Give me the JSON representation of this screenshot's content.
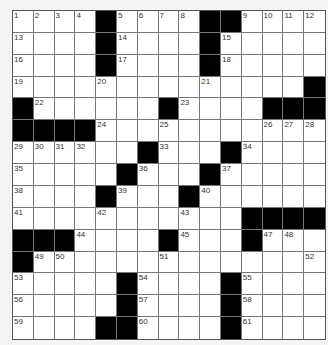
{
  "puzzle": {
    "rows": 15,
    "cols": 15,
    "colors": {
      "block": "#000000",
      "cell": "#ffffff",
      "line": "#777777"
    },
    "grid": [
      "....#....##....",
      "....#....#.....",
      "....#....#.....",
      "..............#",
      "#......#....###",
      "####...........",
      "......#...#....",
      ".....#...#.....",
      "....#...#......",
      "...........####",
      "###....#...#...",
      "#..............",
      ".....#....#....",
      ".....#....#....",
      "....##....#...."
    ],
    "numbers": [
      {
        "r": 0,
        "c": 0,
        "n": "1"
      },
      {
        "r": 0,
        "c": 1,
        "n": "2"
      },
      {
        "r": 0,
        "c": 2,
        "n": "3"
      },
      {
        "r": 0,
        "c": 3,
        "n": "4"
      },
      {
        "r": 0,
        "c": 5,
        "n": "5"
      },
      {
        "r": 0,
        "c": 6,
        "n": "6"
      },
      {
        "r": 0,
        "c": 7,
        "n": "7"
      },
      {
        "r": 0,
        "c": 8,
        "n": "8"
      },
      {
        "r": 0,
        "c": 11,
        "n": "9"
      },
      {
        "r": 0,
        "c": 12,
        "n": "10"
      },
      {
        "r": 0,
        "c": 13,
        "n": "11"
      },
      {
        "r": 0,
        "c": 14,
        "n": "12"
      },
      {
        "r": 1,
        "c": 0,
        "n": "13"
      },
      {
        "r": 1,
        "c": 5,
        "n": "14"
      },
      {
        "r": 1,
        "c": 10,
        "n": "15"
      },
      {
        "r": 2,
        "c": 0,
        "n": "16"
      },
      {
        "r": 2,
        "c": 5,
        "n": "17"
      },
      {
        "r": 2,
        "c": 10,
        "n": "18"
      },
      {
        "r": 3,
        "c": 0,
        "n": "19"
      },
      {
        "r": 3,
        "c": 4,
        "n": "20"
      },
      {
        "r": 3,
        "c": 9,
        "n": "21"
      },
      {
        "r": 4,
        "c": 1,
        "n": "22"
      },
      {
        "r": 4,
        "c": 8,
        "n": "23"
      },
      {
        "r": 5,
        "c": 4,
        "n": "24"
      },
      {
        "r": 5,
        "c": 7,
        "n": "25"
      },
      {
        "r": 5,
        "c": 12,
        "n": "26"
      },
      {
        "r": 5,
        "c": 13,
        "n": "27"
      },
      {
        "r": 5,
        "c": 14,
        "n": "28"
      },
      {
        "r": 6,
        "c": 0,
        "n": "29"
      },
      {
        "r": 6,
        "c": 1,
        "n": "30"
      },
      {
        "r": 6,
        "c": 2,
        "n": "31"
      },
      {
        "r": 6,
        "c": 3,
        "n": "32"
      },
      {
        "r": 6,
        "c": 7,
        "n": "33"
      },
      {
        "r": 6,
        "c": 11,
        "n": "34"
      },
      {
        "r": 7,
        "c": 0,
        "n": "35"
      },
      {
        "r": 7,
        "c": 6,
        "n": "36"
      },
      {
        "r": 7,
        "c": 10,
        "n": "37"
      },
      {
        "r": 8,
        "c": 0,
        "n": "38"
      },
      {
        "r": 8,
        "c": 5,
        "n": "39"
      },
      {
        "r": 8,
        "c": 9,
        "n": "40"
      },
      {
        "r": 9,
        "c": 0,
        "n": "41"
      },
      {
        "r": 9,
        "c": 4,
        "n": "42"
      },
      {
        "r": 9,
        "c": 8,
        "n": "43"
      },
      {
        "r": 10,
        "c": 3,
        "n": "44"
      },
      {
        "r": 10,
        "c": 8,
        "n": "45"
      },
      {
        "r": 10,
        "c": 11,
        "n": "46"
      },
      {
        "r": 10,
        "c": 12,
        "n": "47"
      },
      {
        "r": 10,
        "c": 13,
        "n": "48"
      },
      {
        "r": 11,
        "c": 1,
        "n": "49"
      },
      {
        "r": 11,
        "c": 2,
        "n": "50"
      },
      {
        "r": 11,
        "c": 7,
        "n": "51"
      },
      {
        "r": 11,
        "c": 14,
        "n": "52"
      },
      {
        "r": 12,
        "c": 0,
        "n": "53"
      },
      {
        "r": 12,
        "c": 6,
        "n": "54"
      },
      {
        "r": 12,
        "c": 11,
        "n": "55"
      },
      {
        "r": 13,
        "c": 0,
        "n": "56"
      },
      {
        "r": 13,
        "c": 6,
        "n": "57"
      },
      {
        "r": 13,
        "c": 11,
        "n": "58"
      },
      {
        "r": 14,
        "c": 0,
        "n": "59"
      },
      {
        "r": 14,
        "c": 6,
        "n": "60"
      },
      {
        "r": 14,
        "c": 11,
        "n": "61"
      }
    ]
  }
}
